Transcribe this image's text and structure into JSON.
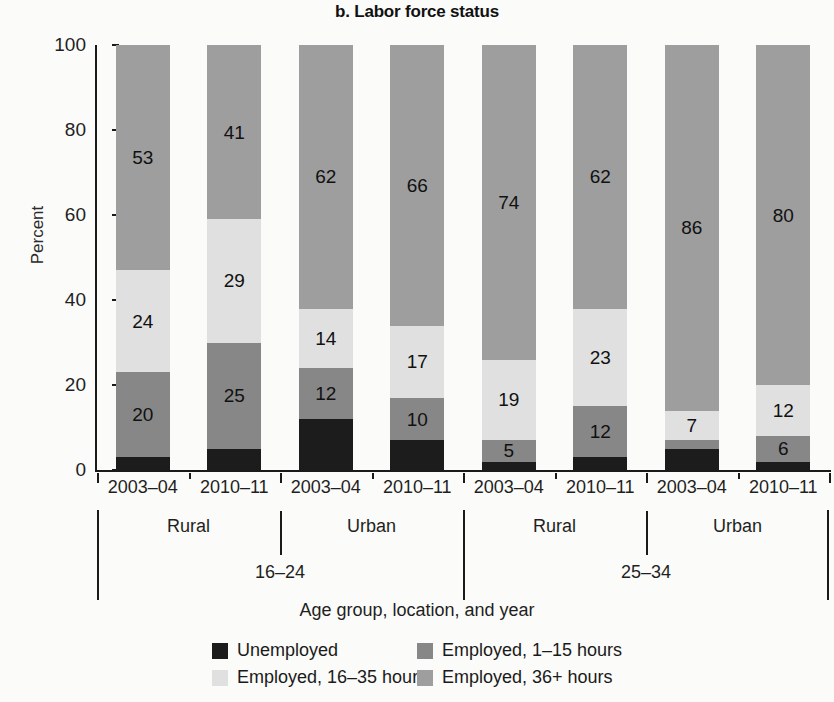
{
  "chart_data": {
    "type": "bar",
    "subtype": "stacked-100-percent",
    "title": "b. Labor force status",
    "xlabel": "Age group, location, and year",
    "ylabel": "Percent",
    "ylim": [
      0,
      100
    ],
    "yticks": [
      0,
      20,
      40,
      60,
      80,
      100
    ],
    "grid": false,
    "legend_position": "bottom",
    "categories": [
      "16-24 / Rural / 2003-04",
      "16-24 / Rural / 2010-11",
      "16-24 / Urban / 2003-04",
      "16-24 / Urban / 2010-11",
      "25-34 / Rural / 2003-04",
      "25-34 / Rural / 2010-11",
      "25-34 / Urban / 2003-04",
      "25-34 / Urban / 2010-11"
    ],
    "series": [
      {
        "name": "Unemployed",
        "color": "#1c1c1c",
        "values": [
          3,
          5,
          12,
          7,
          2,
          3,
          5,
          2
        ]
      },
      {
        "name": "Employed, 1-15 hours",
        "color": "#878787",
        "values": [
          20,
          25,
          12,
          10,
          5,
          12,
          7,
          6
        ]
      },
      {
        "name": "Employed, 16-35 hours",
        "color": "#e0e0e0",
        "values": [
          24,
          29,
          14,
          17,
          19,
          23,
          2,
          12
        ]
      },
      {
        "name": "Employed, 36+ hours",
        "color": "#9e9e9e",
        "values": [
          53,
          41,
          62,
          66,
          74,
          62,
          86,
          80
        ]
      }
    ],
    "bars": [
      {
        "age": "16-24",
        "location": "Rural",
        "year": "2003-04",
        "segments": [
          {
            "series": "Employed, 36+ hours",
            "value": 53,
            "label": "53"
          },
          {
            "series": "Employed, 16-35 hours",
            "value": 24,
            "label": "24"
          },
          {
            "series": "Employed, 1-15 hours",
            "value": 20,
            "label": "20"
          },
          {
            "series": "Unemployed",
            "value": 3,
            "label": ""
          }
        ]
      },
      {
        "age": "16-24",
        "location": "Rural",
        "year": "2010-11",
        "segments": [
          {
            "series": "Employed, 36+ hours",
            "value": 41,
            "label": "41"
          },
          {
            "series": "Employed, 16-35 hours",
            "value": 29,
            "label": "29"
          },
          {
            "series": "Employed, 1-15 hours",
            "value": 25,
            "label": "25"
          },
          {
            "series": "Unemployed",
            "value": 5,
            "label": ""
          }
        ]
      },
      {
        "age": "16-24",
        "location": "Urban",
        "year": "2003-04",
        "segments": [
          {
            "series": "Employed, 36+ hours",
            "value": 62,
            "label": "62"
          },
          {
            "series": "Employed, 16-35 hours",
            "value": 14,
            "label": "14"
          },
          {
            "series": "Employed, 1-15 hours",
            "value": 12,
            "label": "12"
          },
          {
            "series": "Unemployed",
            "value": 12,
            "label": ""
          }
        ]
      },
      {
        "age": "16-24",
        "location": "Urban",
        "year": "2010-11",
        "segments": [
          {
            "series": "Employed, 36+ hours",
            "value": 66,
            "label": "66"
          },
          {
            "series": "Employed, 16-35 hours",
            "value": 17,
            "label": "17"
          },
          {
            "series": "Employed, 1-15 hours",
            "value": 10,
            "label": "10"
          },
          {
            "series": "Unemployed",
            "value": 7,
            "label": ""
          }
        ]
      },
      {
        "age": "25-34",
        "location": "Rural",
        "year": "2003-04",
        "segments": [
          {
            "series": "Employed, 36+ hours",
            "value": 74,
            "label": "74"
          },
          {
            "series": "Employed, 16-35 hours",
            "value": 19,
            "label": "19"
          },
          {
            "series": "Employed, 1-15 hours",
            "value": 5,
            "label": "5"
          },
          {
            "series": "Unemployed",
            "value": 2,
            "label": ""
          }
        ]
      },
      {
        "age": "25-34",
        "location": "Rural",
        "year": "2010-11",
        "segments": [
          {
            "series": "Employed, 36+ hours",
            "value": 62,
            "label": "62"
          },
          {
            "series": "Employed, 16-35 hours",
            "value": 23,
            "label": "23"
          },
          {
            "series": "Employed, 1-15 hours",
            "value": 12,
            "label": "12"
          },
          {
            "series": "Unemployed",
            "value": 3,
            "label": ""
          }
        ]
      },
      {
        "age": "25-34",
        "location": "Urban",
        "year": "2003-04",
        "segments": [
          {
            "series": "Employed, 36+ hours",
            "value": 86,
            "label": "86"
          },
          {
            "series": "Employed, 16-35 hours",
            "value": 7,
            "label": "7"
          },
          {
            "series": "Employed, 1-15 hours",
            "value": 2,
            "label": ""
          },
          {
            "series": "Unemployed",
            "value": 5,
            "label": ""
          }
        ]
      },
      {
        "age": "25-34",
        "location": "Urban",
        "year": "2010-11",
        "segments": [
          {
            "series": "Employed, 36+ hours",
            "value": 80,
            "label": "80"
          },
          {
            "series": "Employed, 16-35 hours",
            "value": 12,
            "label": "12"
          },
          {
            "series": "Employed, 1-15 hours",
            "value": 6,
            "label": "6"
          },
          {
            "series": "Unemployed",
            "value": 2,
            "label": ""
          }
        ]
      }
    ]
  },
  "axis": {
    "y_label": "Percent",
    "y_ticks": [
      "100",
      "80",
      "60",
      "40",
      "20",
      "0"
    ],
    "x_title": "Age group, location, and year",
    "tier_year": [
      "2003–04",
      "2010–11",
      "2003–04",
      "2010–11",
      "2003–04",
      "2010–11",
      "2003–04",
      "2010–11"
    ],
    "tier_location": [
      "Rural",
      "Urban",
      "Rural",
      "Urban"
    ],
    "tier_age": [
      "16–24",
      "25–34"
    ]
  },
  "legend": {
    "items": [
      {
        "label": "Unemployed",
        "color": "#1c1c1c"
      },
      {
        "label": "Employed, 1–15 hours",
        "color": "#878787"
      },
      {
        "label": "Employed, 16–35 hours",
        "color": "#e0e0e0"
      },
      {
        "label": "Employed, 36+ hours",
        "color": "#9e9e9e"
      }
    ]
  }
}
